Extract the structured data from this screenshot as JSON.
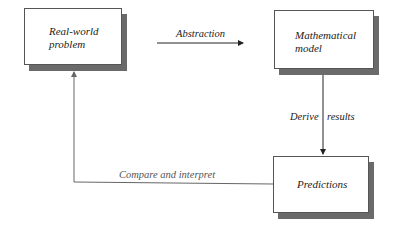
{
  "diagram": {
    "nodes": [
      {
        "id": "real",
        "line1": "Real-world",
        "line2": "problem"
      },
      {
        "id": "math",
        "line1": "Mathematical",
        "line2": "model"
      },
      {
        "id": "pred",
        "line1": "Predictions"
      }
    ],
    "edges": [
      {
        "from": "real",
        "to": "math",
        "label": "Abstraction"
      },
      {
        "from": "math",
        "to": "pred",
        "label_left": "Derive",
        "label_right": "results"
      },
      {
        "from": "pred",
        "to": "real",
        "label": "Compare and interpret"
      }
    ]
  }
}
